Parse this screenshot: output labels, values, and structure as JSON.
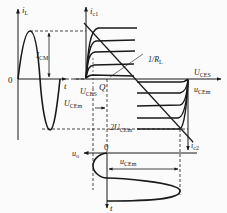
{
  "diagram": {
    "left_plot": {
      "y_axis_label": "i",
      "y_axis_sub": "L",
      "x_axis_label": "t",
      "origin_label": "0",
      "amplitude_label": "I",
      "amplitude_sub": "CM"
    },
    "upper_right_plot": {
      "y_axis_label": "i",
      "y_axis_sub": "c1",
      "saturation_label": "U",
      "saturation_sub": "CES",
      "load_line_label": "1/R",
      "load_line_sub": "L",
      "q_point_label": "Q"
    },
    "right_plot": {
      "x_axis_label": "u",
      "x_axis_sub": "CEm",
      "saturation_label": "U",
      "saturation_sub": "CES",
      "y_axis_label": "i",
      "y_axis_sub": "c2",
      "dimension_1_label": "U",
      "dimension_1_sub": "CEm",
      "dimension_2_label": "2U",
      "dimension_2_sub": "CEm"
    },
    "bottom_plot": {
      "x_axis_label": "u",
      "x_axis_sub": "o",
      "origin_label": "0",
      "amplitude_label": "u",
      "amplitude_sub": "CEm",
      "time_label": "t"
    },
    "colors": {
      "ink": "#1a1a1a",
      "background": "#fbfbfb"
    }
  }
}
